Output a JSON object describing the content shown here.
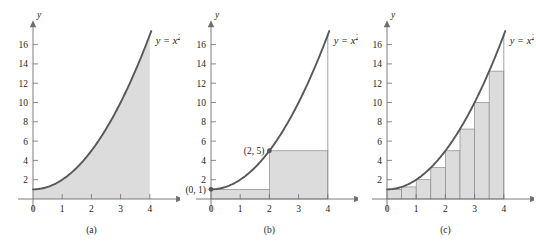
{
  "figure": {
    "background_color": "#ffffff",
    "curve_color": "#58585a",
    "fill_color": "#dcdcdc",
    "rect_stroke_color": "#8c8c8c",
    "axis_color": "#6d6e71",
    "text_color": "#231f20",
    "function_label": "y = x",
    "function_exponent": "2",
    "function_tail": " + 1",
    "x_axis_name": "x",
    "y_axis_name": "y",
    "x_ticks": [
      0,
      1,
      2,
      3,
      4
    ],
    "x_tick_labels": [
      "0",
      "1",
      "2",
      "3",
      "4"
    ],
    "y_ticks": [
      2,
      4,
      6,
      8,
      10,
      12,
      14,
      16
    ],
    "y_tick_labels": [
      "2",
      "4",
      "6",
      "8",
      "10",
      "12",
      "14",
      "16"
    ],
    "x_range": [
      0,
      4.35
    ],
    "y_range": [
      0,
      17.6
    ]
  },
  "chart_data": [
    {
      "type": "area",
      "panel": "a",
      "caption": "(a)",
      "title": "y = x^2 + 1",
      "xlabel": "x",
      "ylabel": "y",
      "xlim": [
        0,
        4.35
      ],
      "ylim": [
        0,
        17.6
      ],
      "x_ticks": [
        0,
        1,
        2,
        3,
        4
      ],
      "y_ticks": [
        2,
        4,
        6,
        8,
        10,
        12,
        14,
        16
      ],
      "grid": false,
      "legend": "none",
      "curve": {
        "expression": "x^2 + 1",
        "x_start": 0,
        "x_end": 4.05,
        "points_x": [
          0,
          0.5,
          1,
          1.5,
          2,
          2.5,
          3,
          3.5,
          4
        ],
        "points_y": [
          1,
          1.25,
          2,
          3.25,
          5,
          7.25,
          10,
          13.25,
          17
        ]
      },
      "shaded_region": {
        "description": "exact area under curve from x=0 to x=4",
        "x_start": 0,
        "x_end": 4,
        "exact_area": 25.333
      },
      "rectangles": []
    },
    {
      "type": "bar",
      "panel": "b",
      "caption": "(b)",
      "title": "y = x^2 + 1",
      "xlabel": "x",
      "ylabel": "y",
      "xlim": [
        0,
        4.35
      ],
      "ylim": [
        0,
        17.6
      ],
      "x_ticks": [
        0,
        1,
        2,
        3,
        4
      ],
      "y_ticks": [
        2,
        4,
        6,
        8,
        10,
        12,
        14,
        16
      ],
      "grid": false,
      "legend": "none",
      "curve": {
        "expression": "x^2 + 1",
        "x_start": 0,
        "x_end": 4.05,
        "points_x": [
          0,
          0.5,
          1,
          1.5,
          2,
          2.5,
          3,
          3.5,
          4
        ],
        "points_y": [
          1,
          1.25,
          2,
          3.25,
          5,
          7.25,
          10,
          13.25,
          17
        ]
      },
      "rectangle_rule": "left endpoint",
      "n_rectangles": 2,
      "rect_width": 2,
      "rect_x_left": [
        0,
        2
      ],
      "rect_heights": [
        1,
        5
      ],
      "approx_area": 12,
      "markers": [
        {
          "x": 0,
          "y": 1,
          "label": "(0, 1)",
          "label_side": "left"
        },
        {
          "x": 2,
          "y": 5,
          "label": "(2, 5)",
          "label_side": "left"
        }
      ],
      "vertical_line_at_x": 4
    },
    {
      "type": "bar",
      "panel": "c",
      "caption": "(c)",
      "title": "y = x^2 + 1",
      "xlabel": "x",
      "ylabel": "y",
      "xlim": [
        0,
        4.35
      ],
      "ylim": [
        0,
        17.6
      ],
      "x_ticks": [
        0,
        1,
        2,
        3,
        4
      ],
      "y_ticks": [
        2,
        4,
        6,
        8,
        10,
        12,
        14,
        16
      ],
      "grid": false,
      "legend": "none",
      "curve": {
        "expression": "x^2 + 1",
        "x_start": 0,
        "x_end": 4.05,
        "points_x": [
          0,
          0.5,
          1,
          1.5,
          2,
          2.5,
          3,
          3.5,
          4
        ],
        "points_y": [
          1,
          1.25,
          2,
          3.25,
          5,
          7.25,
          10,
          13.25,
          17
        ]
      },
      "rectangle_rule": "left endpoint",
      "n_rectangles": 8,
      "rect_width": 0.5,
      "rect_x_left": [
        0,
        0.5,
        1,
        1.5,
        2,
        2.5,
        3,
        3.5
      ],
      "rect_heights": [
        1,
        1.25,
        2,
        3.25,
        5,
        7.25,
        10,
        13.25
      ],
      "approx_area": 21.5,
      "markers": [],
      "vertical_line_at_x": 4
    }
  ]
}
